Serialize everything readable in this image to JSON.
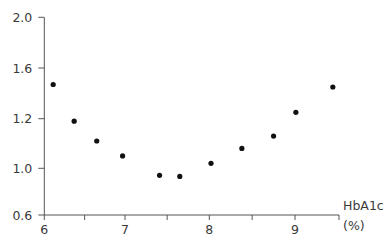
{
  "chart_data": {
    "type": "scatter",
    "title": "",
    "xlabel": "HbA1c (%)",
    "xlabel_lines": [
      "HbA1c",
      "(%)"
    ],
    "ylabel": "",
    "xlim": [
      6,
      9.5
    ],
    "ylim": [
      0.6,
      2.0
    ],
    "x_ticks": [
      6,
      7,
      8,
      9
    ],
    "x_tick_labels": [
      "6",
      "7",
      "8",
      "9"
    ],
    "x_minor_ticks": [
      6.5,
      7.5,
      8.5,
      9.5
    ],
    "y_ticks": [
      0.6,
      1.0,
      1.2,
      1.6,
      2.0
    ],
    "y_tick_labels": [
      "0.6",
      "1.0",
      "1.2",
      "1.6",
      "2.0"
    ],
    "grid": false,
    "legend": null,
    "series": [
      {
        "name": "data",
        "color": "#111111",
        "x": [
          6.11,
          6.37,
          6.65,
          6.97,
          7.41,
          7.65,
          8.02,
          8.38,
          8.75,
          9.01,
          9.43
        ],
        "y": [
          1.47,
          1.19,
          1.11,
          1.05,
          0.94,
          0.93,
          1.02,
          1.08,
          1.13,
          1.25,
          1.45
        ]
      }
    ]
  },
  "layout": {
    "x_pixel_map": [
      [
        6,
        44.3
      ],
      [
        7,
        125
      ],
      [
        8,
        209.3
      ],
      [
        9,
        295
      ],
      [
        9.5,
        339
      ]
    ],
    "y_pixel_map": [
      [
        0.6,
        215
      ],
      [
        1.0,
        168.3
      ],
      [
        1.2,
        118.7
      ],
      [
        1.6,
        68
      ],
      [
        2.0,
        17.3
      ]
    ]
  }
}
